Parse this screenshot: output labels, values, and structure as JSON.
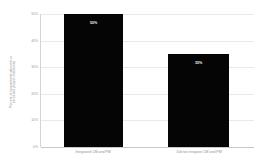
{
  "chart_data": {
    "type": "bar",
    "title": "",
    "xlabel": "",
    "ylabel_lines": [
      "Percent of respondents who met or",
      "exceeded project milestones"
    ],
    "categories": [
      "Integrated CM and PM",
      "Did not integrate CM and PM"
    ],
    "values": [
      50,
      35
    ],
    "value_labels": [
      "50%",
      "35%"
    ],
    "ylim": [
      0,
      50
    ],
    "yticks": [
      0,
      10,
      20,
      30,
      40,
      50
    ],
    "ytick_labels": [
      "0%",
      "10%",
      "20%",
      "30%",
      "40%",
      "50%"
    ],
    "grid": true,
    "legend": false,
    "bar_color": "#050505",
    "gridline_color": "#e9e9e9",
    "axis_color": "#c9c9c9",
    "label_color": "#8f8f8f",
    "value_label_color": "#f2f2f2"
  }
}
